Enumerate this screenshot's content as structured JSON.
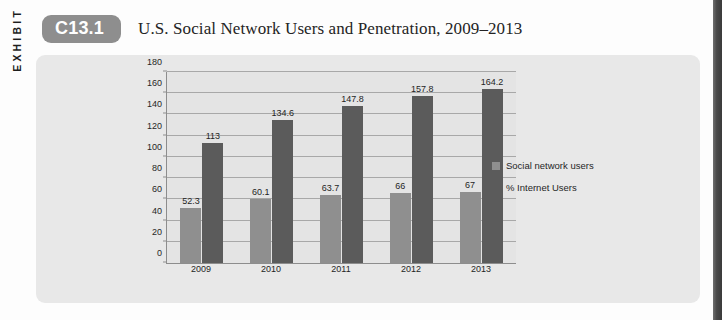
{
  "exhibit": {
    "side_label": "EXHIBIT",
    "badge": "C13.1",
    "title": "U.S. Social Network Users and Penetration, 2009–2013"
  },
  "colors": {
    "badge_background": "#8e8e8e",
    "panel_background": "#e8e8e8",
    "plot_background": "#e4e4e4",
    "gridline": "#a8a8a8",
    "series_users": "#8f8f8f",
    "series_penetration": "#5b5b5b",
    "page_edge_shadow": "#3b3b3b"
  },
  "chart_data": {
    "type": "bar",
    "title": "U.S. Social Network Users and Penetration, 2009–2013",
    "xlabel": "",
    "ylabel": "",
    "ylim": [
      0,
      180
    ],
    "yticks": [
      0,
      20,
      40,
      60,
      80,
      100,
      120,
      140,
      160,
      180
    ],
    "ytick_labels": [
      "0",
      "20",
      "40",
      "60",
      "80",
      "100",
      "120",
      "140",
      "160",
      "180"
    ],
    "grid": true,
    "legend_position": "right",
    "categories": [
      "2009",
      "2010",
      "2011",
      "2012",
      "2013"
    ],
    "series": [
      {
        "name": "Social network users",
        "color": "#8f8f8f",
        "values": [
          52.3,
          60.1,
          63.7,
          66,
          67
        ],
        "labels": [
          "52.3",
          "60.1",
          "63.7",
          "66",
          "67"
        ]
      },
      {
        "name": "% Internet Users",
        "color": "#5b5b5b",
        "values": [
          113,
          134.6,
          147.8,
          157.8,
          164.2
        ],
        "labels": [
          "113",
          "134.6",
          "147.8",
          "157.8",
          "164.2"
        ]
      }
    ]
  }
}
